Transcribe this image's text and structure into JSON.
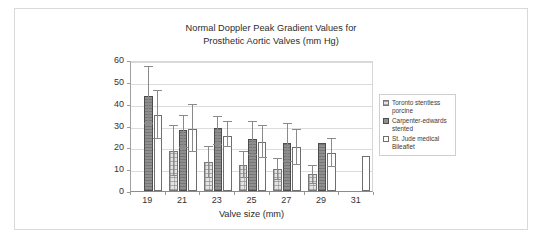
{
  "chart_data": {
    "type": "bar",
    "title": "Normal Doppler Peak Gradient Values for Prosthetic Aortic Valves (mm Hg)",
    "title_lines": [
      "Normal Doppler Peak Gradient Values for",
      "Prosthetic Aortic Valves (mm Hg)"
    ],
    "xlabel": "Valve size (mm)",
    "ylabel": "",
    "categories": [
      "19",
      "21",
      "23",
      "25",
      "27",
      "29",
      "31"
    ],
    "ylim": [
      0,
      60
    ],
    "yticks": [
      0,
      10,
      20,
      30,
      40,
      50,
      60
    ],
    "ytick_labels": [
      "0",
      "10",
      "20",
      "30",
      "40",
      "50",
      "60"
    ],
    "grid": true,
    "legend_position": "right",
    "error_bars": true,
    "series": [
      {
        "name": "Toronto stentless porcine",
        "name_lines": [
          "Toronto stentless",
          "porcine"
        ],
        "fill": "#e3e3e3",
        "pattern": "crosshatch-dotted",
        "values": [
          null,
          18.5,
          13.5,
          12.0,
          10.0,
          8.0,
          null
        ],
        "err_low": [
          null,
          7.0,
          6.0,
          6.0,
          5.0,
          3.0,
          null
        ],
        "err_high": [
          null,
          30.0,
          20.0,
          18.0,
          14.5,
          11.5,
          null
        ]
      },
      {
        "name": "Carpenter-edwards stented",
        "name_lines": [
          "Carpenter-edwards",
          "stented"
        ],
        "fill": "#8f8f8f",
        "pattern": "solid-gray",
        "values": [
          43.5,
          28.0,
          29.0,
          24.0,
          22.0,
          22.0,
          null
        ],
        "err_low": [
          30.5,
          19.5,
          21.0,
          16.5,
          13.5,
          22.0,
          null
        ],
        "err_high": [
          57.0,
          34.5,
          34.0,
          31.5,
          30.5,
          22.0,
          null
        ]
      },
      {
        "name": "St. Jude medical Bileaflet",
        "name_lines": [
          "St. Jude medical",
          "Bileaflet"
        ],
        "fill": "#ffffff",
        "pattern": "white",
        "values": [
          35.0,
          28.5,
          25.0,
          22.5,
          20.0,
          17.5,
          16.0
        ],
        "err_low": [
          24.0,
          18.0,
          20.0,
          15.0,
          12.0,
          11.0,
          null
        ],
        "err_high": [
          46.0,
          39.5,
          31.5,
          30.0,
          28.0,
          24.0,
          null
        ]
      }
    ]
  }
}
